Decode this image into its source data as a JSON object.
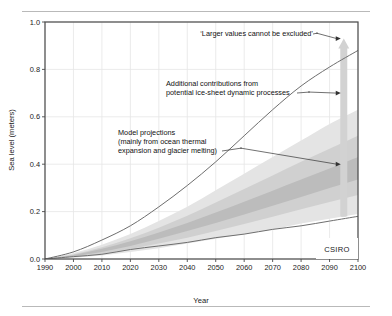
{
  "figure": {
    "source_label": "CSIRO"
  },
  "chart_data": {
    "type": "area",
    "title": "",
    "xlabel": "Year",
    "ylabel": "Sea level (meters)",
    "xlim": [
      1990,
      2100
    ],
    "ylim": [
      0.0,
      1.0
    ],
    "grid": true,
    "legend_position": "none",
    "x_ticks": [
      "1990",
      "2000",
      "2010",
      "2020",
      "2030",
      "2040",
      "2050",
      "2060",
      "2070",
      "2080",
      "2090",
      "2100"
    ],
    "x_tick_values": [
      1990,
      2000,
      2010,
      2020,
      2030,
      2040,
      2050,
      2060,
      2070,
      2080,
      2090,
      2100
    ],
    "y_ticks": [
      "0.0",
      "0.2",
      "0.4",
      "0.6",
      "0.8",
      "1.0"
    ],
    "y_tick_values": [
      0.0,
      0.2,
      0.4,
      0.6,
      0.8,
      1.0
    ],
    "x": [
      1990,
      2000,
      2010,
      2020,
      2030,
      2040,
      2050,
      2060,
      2070,
      2080,
      2090,
      2100
    ],
    "series": [
      {
        "name": "Upper bound curve",
        "type": "line",
        "values": [
          0.0,
          0.03,
          0.08,
          0.14,
          0.22,
          0.31,
          0.41,
          0.52,
          0.63,
          0.73,
          0.81,
          0.88
        ]
      },
      {
        "name": "Lower bound curve",
        "type": "line",
        "values": [
          0.0,
          0.01,
          0.02,
          0.04,
          0.055,
          0.07,
          0.09,
          0.105,
          0.125,
          0.14,
          0.16,
          0.18
        ]
      },
      {
        "name": "Model projection envelope (outer, light)",
        "type": "band",
        "lower": [
          0.0,
          0.005,
          0.015,
          0.03,
          0.045,
          0.065,
          0.085,
          0.105,
          0.125,
          0.15,
          0.17,
          0.19
        ],
        "upper": [
          0.0,
          0.025,
          0.06,
          0.105,
          0.16,
          0.22,
          0.29,
          0.36,
          0.43,
          0.5,
          0.57,
          0.63
        ]
      },
      {
        "name": "Model projection envelope (mid)",
        "type": "band",
        "lower": [
          0.0,
          0.008,
          0.022,
          0.042,
          0.065,
          0.09,
          0.118,
          0.148,
          0.178,
          0.21,
          0.24,
          0.27
        ],
        "upper": [
          0.0,
          0.02,
          0.05,
          0.088,
          0.132,
          0.182,
          0.238,
          0.295,
          0.352,
          0.41,
          0.465,
          0.52
        ]
      },
      {
        "name": "Model projection envelope (inner, dark)",
        "type": "band",
        "lower": [
          0.0,
          0.011,
          0.03,
          0.055,
          0.085,
          0.118,
          0.152,
          0.188,
          0.225,
          0.262,
          0.3,
          0.335
        ],
        "upper": [
          0.0,
          0.017,
          0.043,
          0.075,
          0.112,
          0.152,
          0.196,
          0.242,
          0.288,
          0.335,
          0.382,
          0.43
        ]
      }
    ],
    "range_bars": [
      {
        "name": "Model projections range bar",
        "x": 2095,
        "low": 0.18,
        "high": 0.52,
        "color": "#a8a8a8"
      },
      {
        "name": "Ice-sheet dynamics extended range bar",
        "x": 2095,
        "low": 0.18,
        "high": 0.93,
        "color": "#d2d2d2",
        "arrow": "up"
      }
    ],
    "annotations": [
      {
        "id": "larger-values",
        "text": "‘Larger values cannot be excluded’",
        "target_x": 2095,
        "target_y": 0.93
      },
      {
        "id": "ice-sheet",
        "line1": "Additional contributions from",
        "line2": "potential ice-sheet dynamic processes",
        "target_x": 2095,
        "target_y": 0.7
      },
      {
        "id": "model-projections",
        "line1": "Model projections",
        "line2": "(mainly from ocean thermal",
        "line3": "expansion and glacier melting)",
        "target_x": 2095,
        "target_y": 0.4
      }
    ],
    "colors": {
      "band_light": "#e4e4e4",
      "band_mid": "#d0d0d0",
      "band_dark": "#bcbcbc",
      "curve": "#6e6e6e",
      "grid": "#e6e6e6",
      "frame": "#4a4a4a",
      "text": "#1a1a1a"
    }
  }
}
